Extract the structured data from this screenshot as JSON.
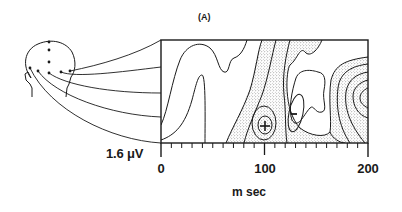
{
  "figure": {
    "panel_label": "(A)",
    "y_scale_label": "1.6 μV",
    "x_axis": {
      "label": "m sec",
      "ticks": [
        {
          "value": 0,
          "label": "0"
        },
        {
          "value": 100,
          "label": "100"
        },
        {
          "value": 200,
          "label": "200"
        }
      ],
      "minor_tick_step": 10,
      "range": [
        0,
        200
      ]
    },
    "head": {
      "electrodes": 7,
      "connected_traces": 5
    },
    "markers": [
      {
        "symbol": "+",
        "label": "positive peak",
        "time_ms": 97
      },
      {
        "symbol": "−",
        "label": "negative peak",
        "time_ms": 128
      }
    ],
    "colors": {
      "ink": "#1a1a1a",
      "stipple": "#6a6a6a",
      "background": "#ffffff"
    }
  }
}
